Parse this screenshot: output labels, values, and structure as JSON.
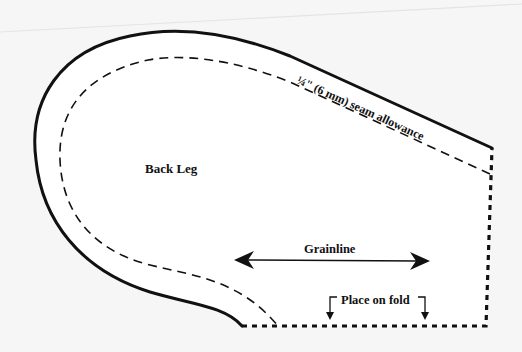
{
  "pattern": {
    "piece_label": "Back Leg",
    "seam_allowance_label": "¼\" (6 mm) seam allowance",
    "grainline_label": "Grainline",
    "fold_label": "Place on fold"
  },
  "colors": {
    "background": "#f6f6f6",
    "paper": "#ffffff",
    "ink": "#111111",
    "shadow_line": "#e2e2e2"
  }
}
